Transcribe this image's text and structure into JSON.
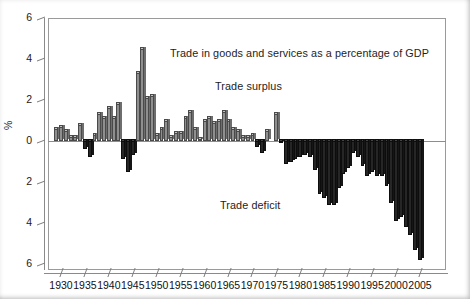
{
  "figure": {
    "background": "#ffffff",
    "bar_positive_color": "#8f8f8f",
    "bar_negative_color": "#262626"
  },
  "annotations": {
    "title": "Trade in goods and services as a percentage of GDP",
    "surplus": "Trade surplus",
    "deficit": "Trade deficit"
  },
  "axes": {
    "ylabel": "%",
    "y_ticks": [
      "6",
      "4",
      "2",
      "0",
      "2",
      "4",
      "6"
    ],
    "x_ticks": [
      "1930",
      "1935",
      "1940",
      "1945",
      "1950",
      "1955",
      "1960",
      "1965",
      "1970",
      "1975",
      "1980",
      "1985",
      "1990",
      "1995",
      "2000",
      "2005"
    ]
  },
  "chart_data": {
    "type": "bar",
    "title": "Trade in goods and services as a percentage of GDP",
    "xlabel": "",
    "ylabel": "%",
    "ylim": [
      -6,
      6
    ],
    "y_tick_values": [
      6,
      4,
      2,
      0,
      -2,
      -4,
      -6
    ],
    "y_tick_labels": [
      "6",
      "4",
      "2",
      "0",
      "2",
      "4",
      "6"
    ],
    "x_tick_values": [
      1930,
      1935,
      1940,
      1945,
      1950,
      1955,
      1960,
      1965,
      1970,
      1975,
      1980,
      1985,
      1990,
      1995,
      2000,
      2005
    ],
    "grid": false,
    "legend": false,
    "notes": [
      "Trade surplus above zero line",
      "Trade deficit below zero line"
    ],
    "categories": [
      1929,
      1930,
      1931,
      1932,
      1933,
      1934,
      1935,
      1936,
      1937,
      1938,
      1939,
      1940,
      1941,
      1942,
      1943,
      1944,
      1945,
      1946,
      1947,
      1948,
      1949,
      1950,
      1951,
      1952,
      1953,
      1954,
      1955,
      1956,
      1957,
      1958,
      1959,
      1960,
      1961,
      1962,
      1963,
      1964,
      1965,
      1966,
      1967,
      1968,
      1969,
      1970,
      1971,
      1972,
      1973,
      1974,
      1975,
      1976,
      1977,
      1978,
      1979,
      1980,
      1981,
      1982,
      1983,
      1984,
      1985,
      1986,
      1987,
      1988,
      1989,
      1990,
      1991,
      1992,
      1993,
      1994,
      1995,
      1996,
      1997,
      1998,
      1999,
      2000,
      2001,
      2002,
      2003,
      2004,
      2005
    ],
    "values": [
      0.6,
      0.7,
      0.5,
      0.2,
      0.2,
      0.8,
      -0.4,
      -0.8,
      0.3,
      1.3,
      1.1,
      1.6,
      1.1,
      1.8,
      -0.9,
      -1.5,
      -0.7,
      3.3,
      4.5,
      2.1,
      2.2,
      0.3,
      0.6,
      1.0,
      0.2,
      0.4,
      0.4,
      1.1,
      1.4,
      0.6,
      0.1,
      1.0,
      1.1,
      0.9,
      1.0,
      1.4,
      1.0,
      0.6,
      0.5,
      0.2,
      0.2,
      0.3,
      -0.3,
      -0.6,
      0.5,
      0.0,
      1.3,
      -0.1,
      -1.1,
      -1.0,
      -0.9,
      -0.8,
      -0.7,
      -0.8,
      -1.4,
      -2.6,
      -2.8,
      -3.1,
      -3.1,
      -2.3,
      -1.6,
      -1.3,
      -0.6,
      -0.8,
      -1.2,
      -1.7,
      -1.5,
      -1.7,
      -1.7,
      -2.2,
      -3.0,
      -3.9,
      -3.7,
      -4.2,
      -4.6,
      -5.3,
      -5.8
    ]
  }
}
